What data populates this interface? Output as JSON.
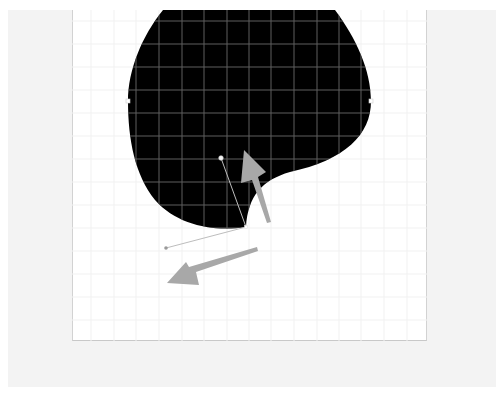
{
  "app": {
    "workspace_color": "#f3f3f3",
    "artboard_color": "#ffffff"
  },
  "canvas": {
    "grid": {
      "spacing_px": 22.6,
      "line_color_on_dark": "#6a6a6a",
      "line_color_on_light": "#f0f0f0"
    },
    "shape": {
      "name": "blob-path",
      "fill": "#000000",
      "anchors": [
        {
          "name": "left-anchor",
          "x": 128,
          "y": 101
        },
        {
          "name": "right-anchor",
          "x": 371,
          "y": 101
        },
        {
          "name": "bottom-cusp-anchor",
          "x": 246,
          "y": 227
        }
      ]
    },
    "handles": [
      {
        "name": "bezier-handle-upper",
        "from": [
          246,
          227
        ],
        "to": [
          221,
          158
        ]
      },
      {
        "name": "bezier-handle-lower",
        "from": [
          246,
          227
        ],
        "to": [
          166,
          248
        ]
      }
    ],
    "arrows": [
      {
        "name": "arrow-up-indicator",
        "color": "#a8a8a8"
      },
      {
        "name": "arrow-down-left-indicator",
        "color": "#a8a8a8"
      }
    ]
  }
}
